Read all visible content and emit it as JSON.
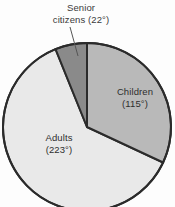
{
  "chart_data": {
    "type": "pie",
    "title": "",
    "unit": "degrees",
    "total_degrees": 360,
    "start_angle_deg": 0,
    "direction": "clockwise",
    "legend_position": "none",
    "grid": false,
    "categories": [
      "Children",
      "Adults",
      "Senior citizens"
    ],
    "values": [
      115,
      223,
      22
    ],
    "slices": [
      {
        "name": "Children",
        "label_line1": "Children",
        "label_line2": "(115°)",
        "value_deg": 115,
        "start_deg": 0,
        "end_deg": 115,
        "color": "#b9b9b9",
        "label_placement": "inside"
      },
      {
        "name": "Adults",
        "label_line1": "Adults",
        "label_line2": "(223°)",
        "value_deg": 223,
        "start_deg": 115,
        "end_deg": 338,
        "color": "#e9e9e9",
        "label_placement": "inside"
      },
      {
        "name": "Senior citizens",
        "label_line1": "Senior",
        "label_line2": "citizens (22°)",
        "value_deg": 22,
        "start_deg": 338,
        "end_deg": 360,
        "color": "#8a8a8a",
        "label_placement": "callout-top"
      }
    ],
    "colors": {
      "children": "#b9b9b9",
      "adults": "#e9e9e9",
      "senior_citizens": "#8a8a8a",
      "outline": "#2b2b2b",
      "background": "#fdfdfd",
      "text": "#333333"
    }
  },
  "geometry": {
    "center_x": 87,
    "center_y": 127,
    "radius": 84
  },
  "labels": {
    "senior_line1": "Senior",
    "senior_line2": "citizens (22°)",
    "children_line1": "Children",
    "children_line2": "(115°)",
    "adults_line1": "Adults",
    "adults_line2": "(223°)"
  }
}
